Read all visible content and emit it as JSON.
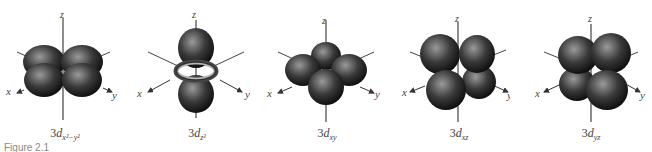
{
  "figure": {
    "caption": "Figure 2.1",
    "orbitals": [
      {
        "name": "3d x2-y2",
        "prefix": "3",
        "d": "d",
        "subscript": "x²−y²",
        "shape": "four-lobes-xy-axes"
      },
      {
        "name": "3d z2",
        "prefix": "3",
        "d": "d",
        "subscript": "z²",
        "shape": "dumbbell-with-torus"
      },
      {
        "name": "3d xy",
        "prefix": "3",
        "d": "d",
        "subscript": "xy",
        "shape": "four-lobes-between-xy"
      },
      {
        "name": "3d xz",
        "prefix": "3",
        "d": "d",
        "subscript": "xz",
        "shape": "four-lobes-between-xz"
      },
      {
        "name": "3d yz",
        "prefix": "3",
        "d": "d",
        "subscript": "yz",
        "shape": "four-lobes-between-yz"
      }
    ],
    "axis_labels": {
      "x": "x",
      "y": "y",
      "z": "z"
    },
    "colors": {
      "lobe_dark": "#1a1a1a",
      "lobe_light": "#8a8a8a",
      "axis": "#333333",
      "ring": "#9a9a9a"
    }
  }
}
